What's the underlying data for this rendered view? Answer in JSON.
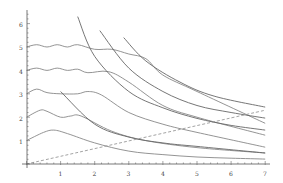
{
  "chart_data": {
    "type": "line",
    "title": "",
    "xlabel": "",
    "ylabel": "",
    "xlim": [
      0,
      7
    ],
    "ylim": [
      0,
      6.5
    ],
    "grid": false,
    "x_ticks": [
      "1",
      "2",
      "3",
      "4",
      "5",
      "6",
      "7"
    ],
    "y_ticks": [
      "1",
      "2",
      "3",
      "4",
      "5",
      "6"
    ],
    "series": [
      {
        "name": "wave-1",
        "style": "solid",
        "points": [
          [
            0,
            1.0
          ],
          [
            0.5,
            1.35
          ],
          [
            0.8,
            1.45
          ],
          [
            1.2,
            1.3
          ],
          [
            2,
            0.9
          ],
          [
            3,
            0.55
          ],
          [
            4,
            0.4
          ],
          [
            5,
            0.3
          ],
          [
            6,
            0.25
          ],
          [
            7,
            0.21
          ]
        ]
      },
      {
        "name": "wave-2",
        "style": "solid",
        "points": [
          [
            0,
            2.0
          ],
          [
            0.4,
            2.3
          ],
          [
            0.6,
            2.25
          ],
          [
            1.0,
            2.0
          ],
          [
            1.3,
            2.05
          ],
          [
            1.6,
            2.05
          ],
          [
            2.5,
            1.4
          ],
          [
            3.5,
            1.0
          ],
          [
            5,
            0.7
          ],
          [
            7,
            0.47
          ]
        ]
      },
      {
        "name": "wave-3",
        "style": "solid",
        "points": [
          [
            0,
            3.0
          ],
          [
            0.3,
            3.2
          ],
          [
            0.6,
            3.05
          ],
          [
            1.0,
            3.0
          ],
          [
            1.5,
            3.0
          ],
          [
            1.8,
            3.1
          ],
          [
            2.2,
            2.95
          ],
          [
            3,
            2.2
          ],
          [
            4,
            1.7
          ],
          [
            5,
            1.35
          ],
          [
            7,
            0.72
          ]
        ]
      },
      {
        "name": "wave-4",
        "style": "solid",
        "points": [
          [
            0,
            4.0
          ],
          [
            0.3,
            4.1
          ],
          [
            0.6,
            4.0
          ],
          [
            0.9,
            4.1
          ],
          [
            1.2,
            4.0
          ],
          [
            1.5,
            4.05
          ],
          [
            1.8,
            3.9
          ],
          [
            2.4,
            3.95
          ],
          [
            3,
            3.5
          ],
          [
            4,
            2.5
          ],
          [
            5,
            2.0
          ],
          [
            7,
            1.23
          ]
        ]
      },
      {
        "name": "wave-5",
        "style": "solid",
        "points": [
          [
            0,
            5.0
          ],
          [
            0.3,
            5.1
          ],
          [
            0.6,
            5.0
          ],
          [
            0.9,
            5.1
          ],
          [
            1.2,
            5.0
          ],
          [
            1.5,
            5.1
          ],
          [
            2.0,
            4.9
          ],
          [
            2.5,
            4.9
          ],
          [
            3,
            4.7
          ],
          [
            3.5,
            4.5
          ],
          [
            4,
            3.8
          ],
          [
            5,
            3.1
          ],
          [
            7,
            1.74
          ]
        ]
      },
      {
        "name": "hyperbola-1",
        "style": "solid",
        "points": [
          [
            1.0,
            3.1
          ],
          [
            2,
            1.7
          ],
          [
            3,
            1.15
          ],
          [
            4,
            0.9
          ],
          [
            5,
            0.75
          ],
          [
            7,
            0.47
          ]
        ]
      },
      {
        "name": "hyperbola-2",
        "style": "solid",
        "points": [
          [
            1.5,
            6.3
          ],
          [
            2,
            4.6
          ],
          [
            3,
            3.1
          ],
          [
            4,
            2.4
          ],
          [
            5,
            1.95
          ],
          [
            6,
            1.65
          ],
          [
            7,
            1.45
          ]
        ]
      },
      {
        "name": "hyperbola-3",
        "style": "solid",
        "points": [
          [
            2.15,
            5.7
          ],
          [
            3,
            4.1
          ],
          [
            4,
            3.1
          ],
          [
            5,
            2.5
          ],
          [
            6,
            2.2
          ],
          [
            7,
            1.96
          ]
        ]
      },
      {
        "name": "hyperbola-4",
        "style": "solid",
        "points": [
          [
            2.85,
            5.4
          ],
          [
            3.5,
            4.4
          ],
          [
            4.5,
            3.5
          ],
          [
            5.5,
            2.9
          ],
          [
            7,
            2.43
          ]
        ]
      },
      {
        "name": "diagonal",
        "style": "dashed",
        "points": [
          [
            0,
            0
          ],
          [
            7,
            2.3
          ]
        ]
      }
    ]
  },
  "axes": {
    "x_labels": [
      "1",
      "2",
      "3",
      "4",
      "5",
      "6",
      "7"
    ],
    "y_labels": [
      "1",
      "2",
      "3",
      "4",
      "5",
      "6"
    ]
  }
}
